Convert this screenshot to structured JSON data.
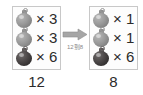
{
  "diagram": {
    "type": "ornament-count-comparison",
    "left_group": {
      "rows": [
        {
          "ornament": "silver-ornament-icon",
          "color": "#9a9a9a",
          "multiplier": "× 3",
          "count": 3
        },
        {
          "ornament": "silver-ornament-icon",
          "color": "#9a9a9a",
          "multiplier": "× 3",
          "count": 3
        },
        {
          "ornament": "dark-ornament-icon",
          "color": "#3a3636",
          "multiplier": "× 6",
          "count": 6
        }
      ],
      "total": "12"
    },
    "right_group": {
      "rows": [
        {
          "ornament": "silver-ornament-icon",
          "color": "#9a9a9a",
          "multiplier": "× 1",
          "count": 1
        },
        {
          "ornament": "silver-ornament-icon",
          "color": "#9a9a9a",
          "multiplier": "× 1",
          "count": 1
        },
        {
          "ornament": "dark-ornament-icon",
          "color": "#3a3636",
          "multiplier": "× 6",
          "count": 6
        }
      ],
      "total": "8"
    },
    "arrow": {
      "icon": "right-arrow-icon",
      "color": "#9a9a9a",
      "caption": "12到8"
    }
  }
}
